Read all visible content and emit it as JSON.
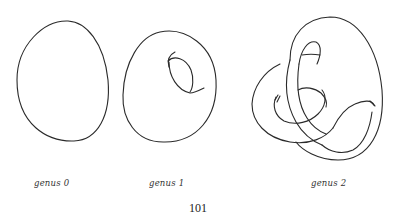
{
  "figure": {
    "panels": [
      {
        "id": "genus-0",
        "label": "genus 0"
      },
      {
        "id": "genus-1",
        "label": "genus 1"
      },
      {
        "id": "genus-2",
        "label": "genus 2"
      }
    ]
  },
  "page": {
    "number": "101"
  }
}
